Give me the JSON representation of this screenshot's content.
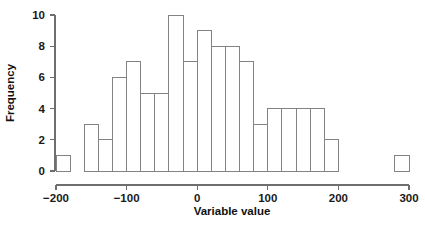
{
  "chart_data": {
    "type": "bar",
    "subtype": "histogram",
    "title": "",
    "xlabel": "Variable value",
    "ylabel": "Frequency",
    "xlim": [
      -200,
      300
    ],
    "ylim": [
      0,
      10
    ],
    "bin_width": 20,
    "grid": false,
    "legend": null,
    "xticks": [
      -200,
      -100,
      0,
      100,
      200,
      300
    ],
    "xtick_labels": [
      "−200",
      "−100",
      "0",
      "100",
      "200",
      "300"
    ],
    "yticks": [
      0,
      2,
      4,
      6,
      8,
      10
    ],
    "ytick_labels": [
      "0",
      "2",
      "4",
      "6",
      "8",
      "10"
    ],
    "bin_edges": [
      -200,
      -180,
      -160,
      -140,
      -120,
      -100,
      -80,
      -60,
      -40,
      -20,
      0,
      20,
      40,
      60,
      80,
      100,
      120,
      140,
      160,
      180,
      200,
      220,
      240,
      260,
      280,
      300
    ],
    "categories": [
      "-200 to -180",
      "-180 to -160",
      "-160 to -140",
      "-140 to -120",
      "-120 to -100",
      "-100 to -80",
      "-80 to -60",
      "-60 to -40",
      "-40 to -20",
      "-20 to 0",
      "0 to 20",
      "20 to 40",
      "40 to 60",
      "60 to 80",
      "80 to 100",
      "100 to 120",
      "120 to 140",
      "140 to 160",
      "160 to 180",
      "180 to 200",
      "200 to 220",
      "220 to 240",
      "240 to 260",
      "260 to 280",
      "280 to 300"
    ],
    "values": [
      1,
      0,
      3,
      2,
      6,
      7,
      5,
      5,
      10,
      7,
      9,
      8,
      8,
      7,
      3,
      4,
      4,
      4,
      4,
      2,
      0,
      0,
      0,
      0,
      1
    ],
    "colors": {
      "bar_fill": "#ffffff",
      "bar_stroke": "#838383",
      "axis": "#6e6e6e",
      "text": "#111111",
      "background": "#ffffff"
    }
  }
}
